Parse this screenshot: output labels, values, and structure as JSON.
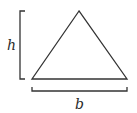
{
  "diagram": {
    "labels": {
      "height": "h",
      "base": "b"
    },
    "colors": {
      "stroke": "#333333",
      "background": "#ffffff"
    },
    "shapes": {
      "triangle": {
        "apex": [
          79,
          11
        ],
        "base_left": [
          32,
          79
        ],
        "base_right": [
          127,
          79
        ]
      },
      "height_bracket": {
        "x": 20,
        "y_top": 11,
        "y_bottom": 79,
        "tick_len": 5
      },
      "base_bracket": {
        "y": 91,
        "x_left": 32,
        "x_right": 127,
        "tick_len": 4
      }
    }
  }
}
